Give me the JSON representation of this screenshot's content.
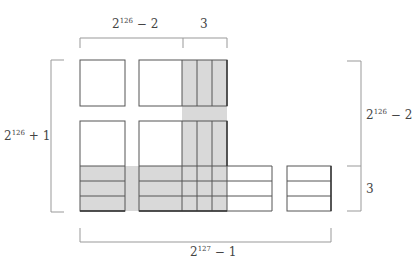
{
  "diagram": {
    "colors": {
      "fill": "#d9d9d9",
      "stroke": "#555555",
      "bracket": "#999999",
      "text": "#444444"
    },
    "labels": {
      "top_left": {
        "base": "2",
        "exp": "126",
        "rest": " − 2"
      },
      "top_right": {
        "text": "3"
      },
      "left": {
        "base": "2",
        "exp": "126",
        "rest": " + 1"
      },
      "right_top": {
        "base": "2",
        "exp": "126",
        "rest": " − 2"
      },
      "right_bottom": {
        "text": "3"
      },
      "bottom": {
        "base": "2",
        "exp": "127",
        "rest": " − 1"
      }
    }
  }
}
